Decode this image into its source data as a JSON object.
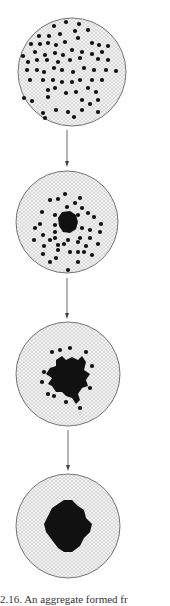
{
  "figure": {
    "caption": "2.16. An aggregate formed fr",
    "colors": {
      "background": "#ffffff",
      "lattice": "#c8c8c8",
      "outline": "#555555",
      "particle": "#111111",
      "arrow": "#444444"
    },
    "stages": [
      {
        "name": "dispersed-particles",
        "cx": 72,
        "cy": 72,
        "r": 54,
        "cluster_r": 0
      },
      {
        "name": "nucleation",
        "cx": 67,
        "cy": 222,
        "r": 51,
        "cluster_r": 10
      },
      {
        "name": "growing-aggregate",
        "cx": 68,
        "cy": 374,
        "r": 52,
        "cluster_r": 17
      },
      {
        "name": "compact-aggregate",
        "cx": 68,
        "cy": 526,
        "r": 52,
        "cluster_r": 25
      }
    ],
    "arrows": [
      {
        "x": 67,
        "y1": 130,
        "y2": 166
      },
      {
        "x": 67,
        "y1": 278,
        "y2": 318
      },
      {
        "x": 68,
        "y1": 430,
        "y2": 470
      }
    ]
  }
}
